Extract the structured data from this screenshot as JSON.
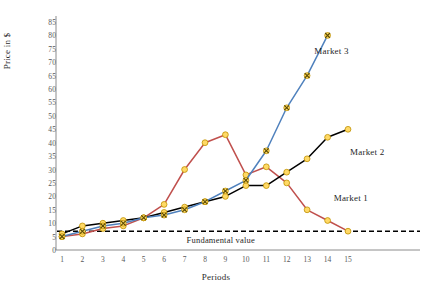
{
  "chart_data": {
    "type": "line",
    "title": "",
    "xlabel": "Periods",
    "ylabel": "Price in $",
    "x": [
      1,
      2,
      3,
      4,
      5,
      6,
      7,
      8,
      9,
      10,
      11,
      12,
      13,
      14,
      15
    ],
    "xlim": [
      1,
      15
    ],
    "ylim": [
      0,
      85
    ],
    "ytick_labels": [
      "0",
      "5",
      "10",
      "15",
      "20",
      "25",
      "30",
      "35",
      "40",
      "45",
      "50",
      "55",
      "60",
      "65",
      "70",
      "75",
      "80",
      "85"
    ],
    "ytick_values": [
      0,
      5,
      10,
      15,
      20,
      25,
      30,
      35,
      40,
      45,
      50,
      55,
      60,
      65,
      70,
      75,
      80,
      85
    ],
    "xtick_labels": [
      "1",
      "2",
      "3",
      "4",
      "5",
      "6",
      "7",
      "8",
      "9",
      "10",
      "11",
      "12",
      "13",
      "14",
      "15"
    ],
    "grid": false,
    "legend": "inline-annotations",
    "series": [
      {
        "name": "Market 1",
        "color": "#C0504D",
        "marker": "circle",
        "marker_fill": "#FFD966",
        "values": [
          5,
          6,
          8,
          9,
          12,
          17,
          30,
          40,
          43,
          28,
          31,
          25,
          15,
          11,
          7
        ]
      },
      {
        "name": "Market 2",
        "color": "#000000",
        "marker": "circle",
        "marker_fill": "#FFD966",
        "values": [
          6,
          9,
          10,
          11,
          12,
          14,
          16,
          18,
          20,
          24,
          24,
          29,
          34,
          42,
          45
        ]
      },
      {
        "name": "Market 3",
        "color": "#4F81BD",
        "marker": "x",
        "marker_fill": "#FFD966",
        "values": [
          5,
          7,
          9,
          10,
          12,
          13,
          15,
          18,
          22,
          26,
          37,
          53,
          65,
          80,
          null
        ]
      }
    ],
    "reference_line": {
      "label": "Fundamental value",
      "value": 7,
      "style": "dashed",
      "color": "#000000"
    },
    "annotations": [
      {
        "text": "Market 3",
        "x": 13.35,
        "y": 74
      },
      {
        "text": "Market 2",
        "x": 15.1,
        "y": 36
      },
      {
        "text": "Market 1",
        "x": 14.3,
        "y": 19
      },
      {
        "text": "Fundamental value",
        "x": 7.1,
        "y": 3.5
      }
    ]
  },
  "axes": {
    "y_title": "Price in $",
    "x_title": "Periods"
  }
}
